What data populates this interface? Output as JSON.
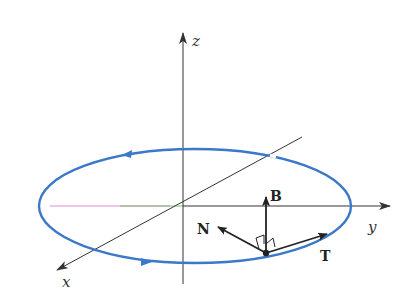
{
  "diagram": {
    "type": "3d-curve-frenet-frame",
    "axes": {
      "x": {
        "label": "x"
      },
      "y": {
        "label": "y"
      },
      "z": {
        "label": "z"
      }
    },
    "curve": {
      "shape": "circle (ellipse in perspective)",
      "color": "#3a78c8",
      "direction": "counterclockwise"
    },
    "vectors": {
      "binormal": {
        "label": "B"
      },
      "normal": {
        "label": "N"
      },
      "tangent": {
        "label": "T"
      }
    },
    "colors": {
      "axis": "#333333",
      "curve": "#3a78c8",
      "vector": "#222222"
    }
  }
}
